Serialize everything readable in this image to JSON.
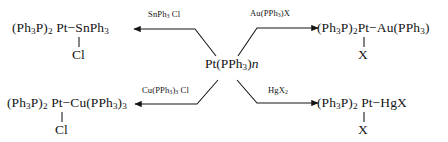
{
  "scheme": {
    "center": {
      "label_html": "Pt(PPh<sub>3</sub>)<span class=\"ital\">n</span>",
      "label_text": "Pt(PPh3)n"
    },
    "branches": [
      {
        "id": "sn",
        "direction": "up-left",
        "reagent_html": "SnPh<sub>3</sub> Cl",
        "reagent_text": "SnPh3 Cl",
        "product_html": "(Ph<sub>3</sub>P)<sub>2</sub> Pt−SnPh<sub>3</sub>",
        "product_text": "(Ph3P)2 Pt-SnPh3",
        "ligand_text": "Cl"
      },
      {
        "id": "au",
        "direction": "up-right",
        "reagent_html": "Au(PPh<sub>3</sub>)X",
        "reagent_text": "Au(PPh3)X",
        "product_html": "(Ph<sub>3</sub>P)<sub>2</sub>Pt−Au(PPh<sub>3</sub>)",
        "product_text": "(Ph3P)2Pt-Au(PPh3)",
        "ligand_text": "X"
      },
      {
        "id": "cu",
        "direction": "down-left",
        "reagent_html": "Cu(PPh<sub>3</sub>)<sub>3</sub> Cl",
        "reagent_text": "Cu(PPh3)3 Cl",
        "product_html": "(Ph<sub>3</sub>P)<sub>2</sub> Pt−Cu(PPh<sub>3</sub>)<sub>3</sub>",
        "product_text": "(Ph3P)2 Pt-Cu(PPh3)3",
        "ligand_text": "Cl"
      },
      {
        "id": "hg",
        "direction": "down-right",
        "reagent_html": "HgX<sub>2</sub>",
        "reagent_text": "HgX2",
        "product_html": "(Ph<sub>3</sub>P)<sub>2</sub> Pt−HgX",
        "product_text": "(Ph3P)2 Pt-HgX",
        "ligand_text": "X"
      }
    ],
    "colors": {
      "ink": "#151515",
      "background": "#ffffff"
    }
  }
}
